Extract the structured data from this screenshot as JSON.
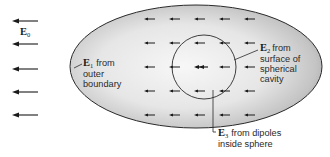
{
  "diagram": {
    "type": "physics-field-diagram",
    "external_field": {
      "symbol": "E",
      "subscript": "0",
      "direction": "left",
      "arrow_count": 5
    },
    "labels": {
      "e1": {
        "symbol": "E",
        "subscript": "1",
        "line1": "from",
        "line2": "outer",
        "line3": "boundary"
      },
      "e2": {
        "symbol": "E",
        "subscript": "2",
        "line1": "from",
        "line2": "surface of",
        "line3": "spherical",
        "line4": "cavity"
      },
      "e3": {
        "symbol": "E",
        "subscript": "3",
        "line1": "from dipoles",
        "line2": "inside sphere"
      }
    },
    "shapes": {
      "outer_body": "ellipse (dielectric)",
      "cavity": "circle (sphere)"
    },
    "colors": {
      "ink": "#1a1a1a",
      "body_fill_light": "#f4f4f4",
      "body_fill_dark": "#a8a8a8"
    }
  }
}
